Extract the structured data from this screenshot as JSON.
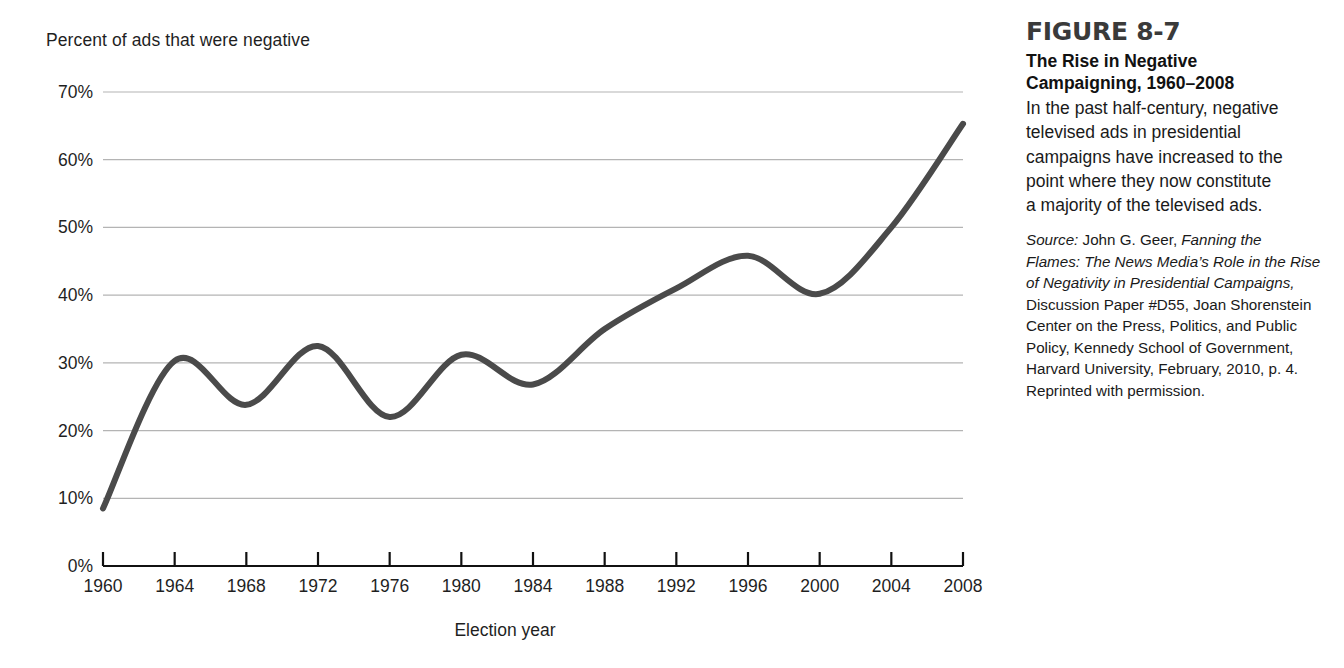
{
  "chart_data": {
    "type": "line",
    "title": "",
    "xlabel": "Election year",
    "ylabel": "Percent of ads that were negative",
    "x": [
      1960,
      1964,
      1968,
      1972,
      1976,
      1980,
      1984,
      1988,
      1992,
      1996,
      2000,
      2004,
      2008
    ],
    "values": [
      8.5,
      30.3,
      23.8,
      32.5,
      22.0,
      31.2,
      26.8,
      35.0,
      41.0,
      45.8,
      40.2,
      50.0,
      65.3
    ],
    "xlim": [
      1960,
      2008
    ],
    "ylim": [
      0,
      70
    ],
    "x_tick_labels": [
      "1960",
      "1964",
      "1968",
      "1972",
      "1976",
      "1980",
      "1984",
      "1988",
      "1992",
      "1996",
      "2000",
      "2004",
      "2008"
    ],
    "y_tick_labels": [
      "0%",
      "10%",
      "20%",
      "30%",
      "40%",
      "50%",
      "60%",
      "70%"
    ],
    "y_tick_values": [
      0,
      10,
      20,
      30,
      40,
      50,
      60,
      70
    ],
    "grid": "horizontal",
    "legend": "none",
    "line_color": "#4a4a4a",
    "grid_color": "#b4b4b4",
    "axis_color": "#111111",
    "smoothing": "spline"
  },
  "caption": {
    "figure_number": "FIGURE 8-7",
    "title_line_1": "The Rise in Negative",
    "title_line_2": "Campaigning, 1960–2008",
    "description_lines": [
      "In the past half-century, negative",
      "televised ads in presidential",
      "campaigns have increased to the",
      "point where they now constitute",
      "a majority of the televised ads."
    ],
    "source_label": "Source:",
    "source_author": " John G. Geer, ",
    "source_title_part_1": "Fanning the",
    "source_title_part_2": "Flames: The News Media’s Role in the Rise",
    "source_title_part_3": "of Negativity in Presidential Campaigns,",
    "source_rest_lines": [
      "Discussion Paper #D55, Joan Shorenstein",
      "Center on the Press, Politics, and Public",
      "Policy, Kennedy School of Government,",
      "Harvard University, February, 2010, p. 4.",
      "Reprinted with permission."
    ]
  }
}
